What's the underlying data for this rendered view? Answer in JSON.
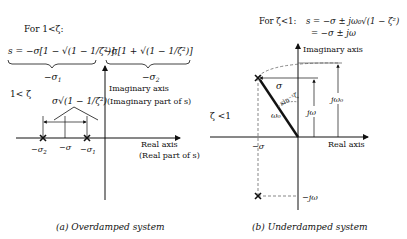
{
  "panel_a": {
    "heading": "For 1<ζ:",
    "eq_s1": "s = −σ[1 − √(1 − 1/ζ²)],",
    "eq_s2": "−σ[1 + √(1 − 1/ζ²)]",
    "label_s1": "−σ",
    "label_s1_sub": "1",
    "label_s2": "−σ",
    "label_s2_sub": "2",
    "condition": "1< ζ",
    "spread_label": "σ√(1 − 1/ζ²)",
    "imag_axis_label": "Imaginary axis",
    "imag_axis_sub": "(Imaginary part of s)",
    "real_axis_label": "Real axis",
    "real_axis_sub": "(Real part of s)",
    "tick_neg_sigma2": "−σ",
    "tick_neg_sigma2_sub": "2",
    "tick_neg_sigma": "−σ",
    "tick_neg_sigma1": "−σ",
    "tick_neg_sigma1_sub": "1",
    "caption": "(a)  Overdamped system"
  },
  "panel_b": {
    "heading": "For ζ<1:",
    "eq_line1": "s = −σ ± jω₀√(1 − ζ²)",
    "eq_line2": "= −σ ± jω",
    "condition": "ζ <1",
    "imag_axis_label": "Imaginary axis",
    "real_axis_label": "Real axis",
    "sigma_label": "σ",
    "angle_label": "sin⁻¹ζ",
    "omega0_label": "ω₀",
    "jomega_label": "jω",
    "jomega0_label": "jω₀",
    "neg_sigma_label": "−σ",
    "neg_jomega_label": "−jω",
    "caption": "(b)  Underdamped system"
  }
}
